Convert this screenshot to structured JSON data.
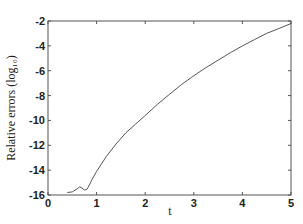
{
  "chart_data": {
    "type": "line",
    "title": "",
    "xlabel": "t",
    "ylabel": "Relative errors (log₁₀)",
    "xlim": [
      0,
      5
    ],
    "ylim": [
      -16,
      -2
    ],
    "xticks": [
      0,
      1,
      2,
      3,
      4,
      5
    ],
    "yticks": [
      -2,
      -4,
      -6,
      -8,
      -10,
      -12,
      -14,
      -16
    ],
    "grid": false,
    "legend": null,
    "series": [
      {
        "name": "relative error",
        "color": "#555555",
        "x": [
          0.4,
          0.5,
          0.6,
          0.65,
          0.7,
          0.75,
          0.8,
          0.85,
          0.9,
          1.0,
          1.2,
          1.4,
          1.6,
          1.8,
          2.0,
          2.25,
          2.5,
          2.75,
          3.0,
          3.25,
          3.5,
          3.75,
          4.0,
          4.25,
          4.5,
          4.75,
          5.0
        ],
        "y": [
          -15.8,
          -15.75,
          -15.5,
          -15.35,
          -15.45,
          -15.6,
          -15.55,
          -15.2,
          -14.8,
          -14.1,
          -12.9,
          -11.9,
          -11.0,
          -10.3,
          -9.6,
          -8.7,
          -7.9,
          -7.1,
          -6.4,
          -5.75,
          -5.15,
          -4.55,
          -4.0,
          -3.5,
          -3.0,
          -2.6,
          -2.2
        ]
      }
    ]
  }
}
